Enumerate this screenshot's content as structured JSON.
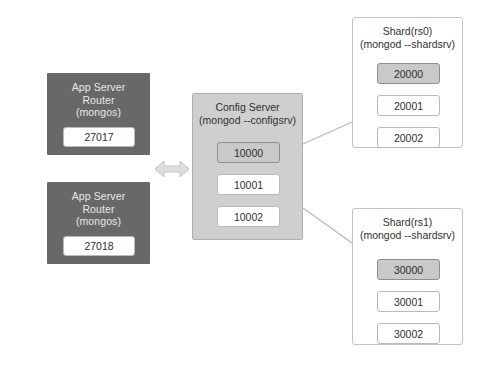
{
  "diagram": {
    "background_color": "#ffffff",
    "app_box_color": "#686868",
    "config_box_color": "#cfcfcf",
    "shard_box_color": "#ffffff",
    "highlight_chip_color": "#c9c9c9",
    "arrow_color": "#d6d6d6"
  },
  "app_servers": [
    {
      "line1": "App Server",
      "line2": "Router",
      "line3": "(mongos)",
      "title": "App Server\nRouter\n(mongos)",
      "port": "27017"
    },
    {
      "line1": "App Server",
      "line2": "Router",
      "line3": "(mongos)",
      "title": "App Server\nRouter\n(mongos)",
      "port": "27018"
    }
  ],
  "config_server": {
    "line1": "Config Server",
    "line2": "(mongod --configsrv)",
    "title": "Config Server\n(mongod --configsrv)",
    "ports": [
      {
        "value": "10000",
        "highlighted": true
      },
      {
        "value": "10001",
        "highlighted": false
      },
      {
        "value": "10002",
        "highlighted": false
      }
    ]
  },
  "shards": [
    {
      "line1": "Shard(rs0)",
      "line2": "(mongod --shardsrv)",
      "title": "Shard(rs0)\n(mongod --shardsrv)",
      "ports": [
        {
          "value": "20000",
          "highlighted": true
        },
        {
          "value": "20001",
          "highlighted": false
        },
        {
          "value": "20002",
          "highlighted": false
        }
      ]
    },
    {
      "line1": "Shard(rs1)",
      "line2": "(mongod --shardsrv)",
      "title": "Shard(rs1)\n(mongod --shardsrv)",
      "ports": [
        {
          "value": "30000",
          "highlighted": true
        },
        {
          "value": "30001",
          "highlighted": false
        },
        {
          "value": "30002",
          "highlighted": false
        }
      ]
    }
  ],
  "connectors": {
    "bidirectional_arrow_label": "",
    "shard0_link_label": "",
    "shard1_link_label": ""
  }
}
